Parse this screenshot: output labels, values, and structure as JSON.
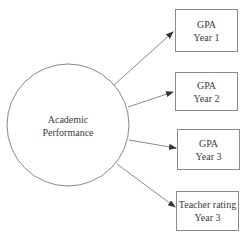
{
  "diagram": {
    "latent": {
      "label_line1": "Academic",
      "label_line2": "Performance"
    },
    "indicators": [
      {
        "line1": "GPA",
        "line2": "Year 1"
      },
      {
        "line1": "GPA",
        "line2": "Year 2"
      },
      {
        "line1": "GPA",
        "line2": "Year 3"
      },
      {
        "line1": "Teacher rating",
        "line2": "Year 3"
      }
    ],
    "edges": [
      {
        "from": "Academic Performance",
        "to": "GPA Year 1"
      },
      {
        "from": "Academic Performance",
        "to": "GPA Year 2"
      },
      {
        "from": "Academic Performance",
        "to": "GPA Year 3"
      },
      {
        "from": "Academic Performance",
        "to": "Teacher rating Year 3"
      }
    ],
    "colors": {
      "stroke": "#8a8a8a",
      "text": "#3a3a3a",
      "background": "#ffffff"
    }
  }
}
